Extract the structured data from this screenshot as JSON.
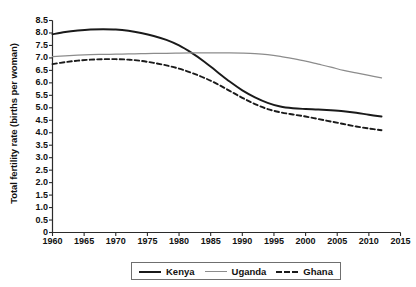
{
  "chart_data": {
    "type": "line",
    "title": "",
    "xlabel": "",
    "ylabel": "Total fertility rate (births per woman)",
    "xlim": [
      1960,
      2015
    ],
    "ylim": [
      0,
      8.5
    ],
    "grid": false,
    "legend_position": "bottom",
    "xticks": [
      "1960",
      "1965",
      "1970",
      "1975",
      "1980",
      "1985",
      "1990",
      "1995",
      "2000",
      "2005",
      "2010",
      "2015"
    ],
    "yticks": [
      "0",
      "0.5",
      "1.0",
      "1.5",
      "2.0",
      "2.5",
      "3.0",
      "3.5",
      "4.0",
      "4.5",
      "5.0",
      "5.5",
      "6.0",
      "6.5",
      "7.0",
      "7.5",
      "8.0",
      "8.5"
    ],
    "x": [
      1960,
      1962,
      1964,
      1966,
      1968,
      1970,
      1972,
      1974,
      1976,
      1978,
      1980,
      1982,
      1984,
      1986,
      1988,
      1990,
      1992,
      1994,
      1996,
      1998,
      2000,
      2002,
      2004,
      2006,
      2008,
      2010,
      2012
    ],
    "series": [
      {
        "name": "Kenya",
        "color": "#1a1a1a",
        "style": "solid",
        "values": [
          7.95,
          8.04,
          8.1,
          8.14,
          8.15,
          8.14,
          8.09,
          8.0,
          7.88,
          7.72,
          7.5,
          7.2,
          6.85,
          6.45,
          6.05,
          5.7,
          5.42,
          5.2,
          5.05,
          4.98,
          4.95,
          4.93,
          4.9,
          4.86,
          4.8,
          4.72,
          4.65
        ]
      },
      {
        "name": "Uganda",
        "color": "#8c8c8c",
        "style": "solid",
        "values": [
          7.05,
          7.08,
          7.11,
          7.13,
          7.14,
          7.15,
          7.16,
          7.17,
          7.18,
          7.18,
          7.19,
          7.2,
          7.2,
          7.2,
          7.2,
          7.19,
          7.17,
          7.13,
          7.06,
          6.97,
          6.87,
          6.75,
          6.63,
          6.5,
          6.4,
          6.3,
          6.2
        ]
      },
      {
        "name": "Ghana",
        "color": "#1a1a1a",
        "style": "dashed",
        "values": [
          6.75,
          6.83,
          6.89,
          6.93,
          6.95,
          6.95,
          6.93,
          6.88,
          6.8,
          6.7,
          6.57,
          6.4,
          6.2,
          5.96,
          5.68,
          5.4,
          5.15,
          4.95,
          4.82,
          4.73,
          4.65,
          4.55,
          4.45,
          4.35,
          4.25,
          4.17,
          4.1
        ]
      }
    ]
  }
}
